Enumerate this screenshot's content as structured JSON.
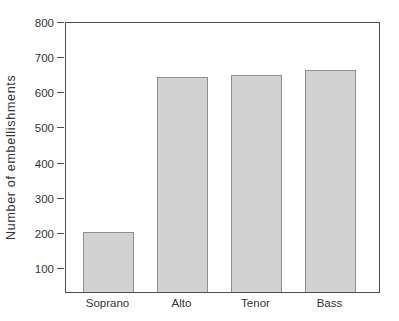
{
  "figure": {
    "background": "#ffffff"
  },
  "chart_data": {
    "type": "bar",
    "categories": [
      "Soprano",
      "Alto",
      "Tenor",
      "Bass"
    ],
    "values": [
      200,
      640,
      645,
      660
    ],
    "title": "",
    "xlabel": "",
    "ylabel": "Number of embellishments",
    "yticks": [
      800,
      700,
      600,
      500,
      400,
      300,
      200,
      100
    ],
    "ylim": [
      30,
      800
    ],
    "grid": false,
    "legend": null,
    "colors": {
      "bar_fill": "#d2d2d2",
      "bar_border": "#8f8f8f",
      "axis": "#4d4d4d",
      "text": "#333333",
      "background": "#ffffff"
    }
  }
}
